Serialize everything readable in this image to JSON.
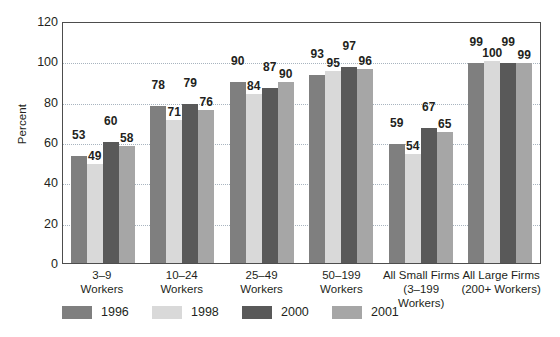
{
  "chart_data": {
    "type": "bar",
    "title": "",
    "xlabel": "",
    "ylabel": "Percent",
    "ylim": [
      0,
      120
    ],
    "ytick_step": 20,
    "yticks": [
      0,
      20,
      40,
      60,
      80,
      100,
      120
    ],
    "grid": "horizontal-dotted",
    "legend_position": "bottom-left",
    "categories": [
      "3–9 Workers",
      "10–24 Workers",
      "25–49 Workers",
      "50–199 Workers",
      "All Small Firms (3–199 Workers)",
      "All Large Firms (200+ Workers)"
    ],
    "category_lines": [
      {
        "line1": "3–9",
        "line2": "Workers"
      },
      {
        "line1": "10–24",
        "line2": "Workers"
      },
      {
        "line1": "25–49",
        "line2": "Workers"
      },
      {
        "line1": "50–199",
        "line2": "Workers"
      },
      {
        "line1": "All Small Firms",
        "line2": "(3–199 Workers)"
      },
      {
        "line1": "All Large Firms",
        "line2": "(200+ Workers)"
      }
    ],
    "series": [
      {
        "name": "1996",
        "color": "#7f7f7f",
        "values": [
          53,
          78,
          90,
          93,
          59,
          99
        ]
      },
      {
        "name": "1998",
        "color": "#d9d9d9",
        "values": [
          49,
          71,
          84,
          95,
          54,
          100
        ]
      },
      {
        "name": "2000",
        "color": "#595959",
        "values": [
          60,
          79,
          87,
          97,
          67,
          99
        ]
      },
      {
        "name": "2001",
        "color": "#a6a6a6",
        "values": [
          58,
          76,
          90,
          96,
          65,
          99
        ]
      }
    ]
  },
  "legend": {
    "items": [
      {
        "label": "1996",
        "color": "#7f7f7f"
      },
      {
        "label": "1998",
        "color": "#d9d9d9"
      },
      {
        "label": "2000",
        "color": "#595959"
      },
      {
        "label": "2001",
        "color": "#a6a6a6"
      }
    ]
  },
  "axis": {
    "y_title": "Percent",
    "y_tick_labels": [
      "120",
      "100",
      "80",
      "60",
      "40",
      "20",
      "0"
    ]
  }
}
